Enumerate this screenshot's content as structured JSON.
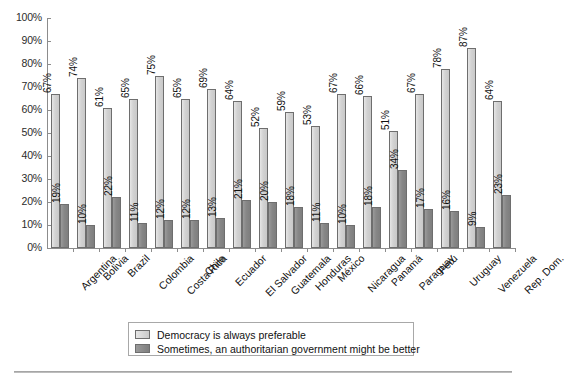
{
  "chart_data": {
    "type": "bar",
    "title": "",
    "subtitle": "",
    "xlabel": "",
    "ylabel": "",
    "ylim": [
      0,
      100
    ],
    "ytick_labels": [
      "100%",
      "90%",
      "80%",
      "70%",
      "60%",
      "50%",
      "40%",
      "30%",
      "20%",
      "10%",
      "0%"
    ],
    "ytick_values": [
      100,
      90,
      80,
      70,
      60,
      50,
      40,
      30,
      20,
      10,
      0
    ],
    "grid": false,
    "legend_position": "bottom-center",
    "value_label_suffix": "%",
    "categories": [
      "Argentina",
      "Bolivia",
      "Brazil",
      "Colombia",
      "Costa Rica",
      "Chile",
      "Ecuador",
      "El Salvador",
      "Guatemala",
      "Honduras",
      "México",
      "Nicaragua",
      "Panamá",
      "Paraguay",
      "Perú",
      "Uruguay",
      "Venezuela",
      "Rep. Dom."
    ],
    "series": [
      {
        "name": "Democracy is always preferable",
        "color": "#d2d2d2",
        "values": [
          67,
          74,
          61,
          65,
          75,
          65,
          69,
          64,
          52,
          59,
          53,
          67,
          66,
          51,
          67,
          78,
          87,
          64
        ],
        "value_labels": [
          "67%",
          "74%",
          "61%",
          "65%",
          "75%",
          "65%",
          "69%",
          "64%",
          "52%",
          "59%",
          "53%",
          "67%",
          "66%",
          "51%",
          "67%",
          "78%",
          "87%",
          "64%"
        ]
      },
      {
        "name": "Sometimes, an authoritarian government might be better",
        "color": "#878787",
        "values": [
          19,
          10,
          22,
          11,
          12,
          12,
          13,
          21,
          20,
          18,
          11,
          10,
          18,
          34,
          17,
          16,
          9,
          23
        ],
        "value_labels": [
          "19%",
          "10%",
          "22%",
          "11%",
          "12%",
          "12%",
          "13%",
          "21%",
          "20%",
          "18%",
          "11%",
          "10%",
          "18%",
          "34%",
          "17%",
          "16%",
          "9%",
          "23%"
        ]
      }
    ]
  },
  "legend": {
    "items": [
      {
        "label": "Democracy is always preferable",
        "swatch": "light"
      },
      {
        "label": "Sometimes, an authoritarian government might be better",
        "swatch": "dark"
      }
    ]
  }
}
